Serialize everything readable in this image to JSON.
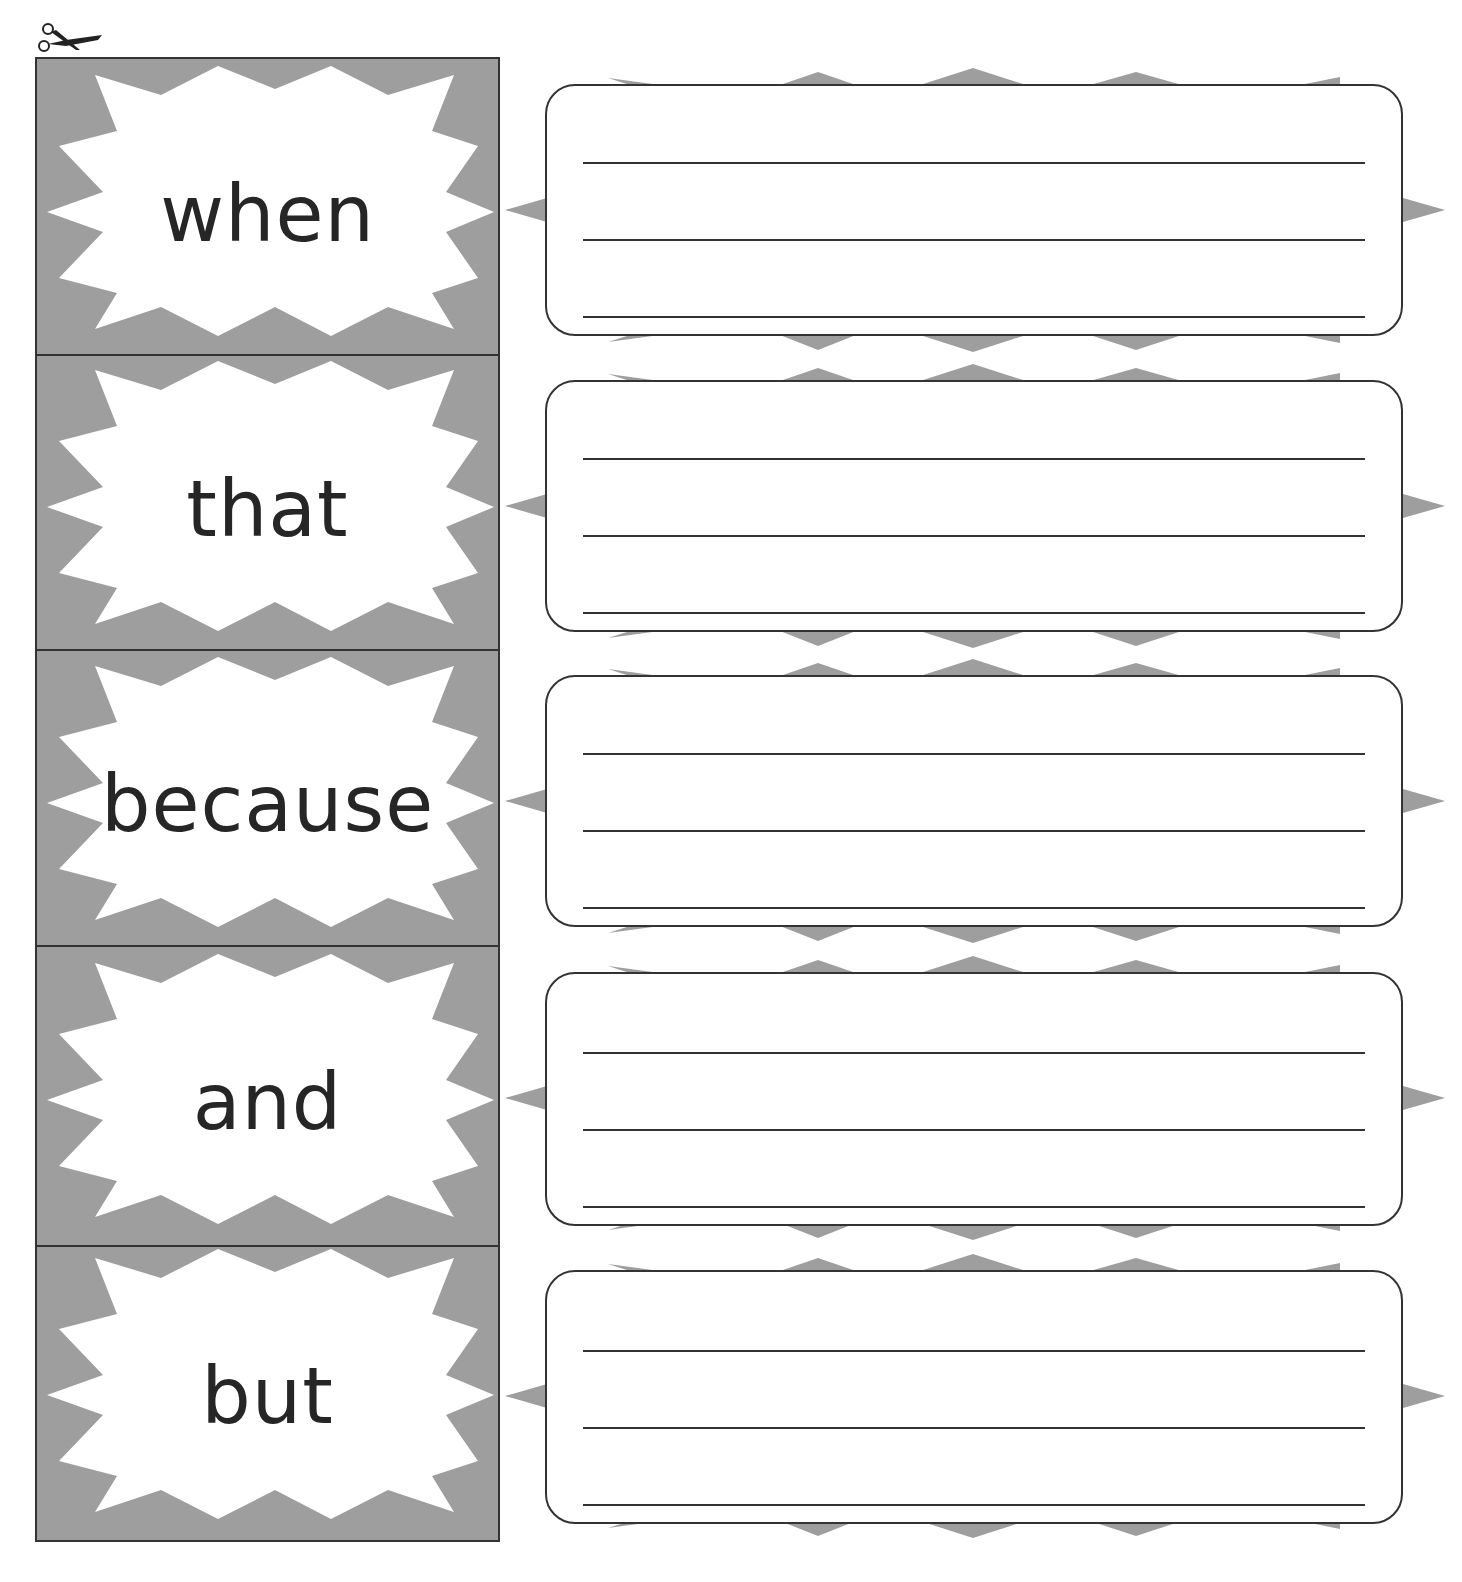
{
  "worksheet": {
    "cut_marker": "scissors-icon",
    "colors": {
      "card_background": "#9e9e9e",
      "burst_fill": "#ffffff",
      "border": "#333333",
      "text": "#262626",
      "spike_fill": "#9e9e9e"
    },
    "cards": [
      {
        "word": "when"
      },
      {
        "word": "that"
      },
      {
        "word": "because"
      },
      {
        "word": "and"
      },
      {
        "word": "but"
      }
    ],
    "writing_boxes": [
      {
        "lines": 3,
        "value": ""
      },
      {
        "lines": 3,
        "value": ""
      },
      {
        "lines": 3,
        "value": ""
      },
      {
        "lines": 3,
        "value": ""
      },
      {
        "lines": 3,
        "value": ""
      }
    ]
  }
}
